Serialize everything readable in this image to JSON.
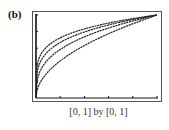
{
  "panel_label": "(b)",
  "window_label": "[0, 1] by [0, 1]",
  "chart_data": {
    "type": "line",
    "title": "",
    "xlabel": "",
    "ylabel": "",
    "xlim": [
      0,
      1
    ],
    "ylim": [
      0,
      1
    ],
    "xticks": [
      0,
      0.2,
      0.4,
      0.6,
      0.8,
      1.0
    ],
    "yticks": [
      0,
      0.2,
      0.4,
      0.6,
      0.8,
      1.0
    ],
    "grid": false,
    "legend": null,
    "series": [
      {
        "name": "y = x^(1/2)",
        "exponent": 0.5,
        "x": [
          0,
          0.05,
          0.1,
          0.2,
          0.4,
          0.6,
          0.8,
          1.0
        ],
        "values": [
          0,
          0.224,
          0.316,
          0.447,
          0.632,
          0.775,
          0.894,
          1.0
        ]
      },
      {
        "name": "y = x^(1/3)",
        "exponent": 0.3333,
        "x": [
          0,
          0.05,
          0.1,
          0.2,
          0.4,
          0.6,
          0.8,
          1.0
        ],
        "values": [
          0,
          0.368,
          0.464,
          0.585,
          0.737,
          0.843,
          0.928,
          1.0
        ]
      },
      {
        "name": "y = x^(1/4)",
        "exponent": 0.25,
        "x": [
          0,
          0.05,
          0.1,
          0.2,
          0.4,
          0.6,
          0.8,
          1.0
        ],
        "values": [
          0,
          0.473,
          0.562,
          0.669,
          0.795,
          0.88,
          0.946,
          1.0
        ]
      },
      {
        "name": "y = x^(1/5)",
        "exponent": 0.2,
        "x": [
          0,
          0.05,
          0.1,
          0.2,
          0.4,
          0.6,
          0.8,
          1.0
        ],
        "values": [
          0,
          0.549,
          0.631,
          0.725,
          0.833,
          0.903,
          0.956,
          1.0
        ]
      }
    ],
    "colors": {
      "curve": "#222222",
      "axis": "#111111",
      "frame": "#555555"
    }
  }
}
